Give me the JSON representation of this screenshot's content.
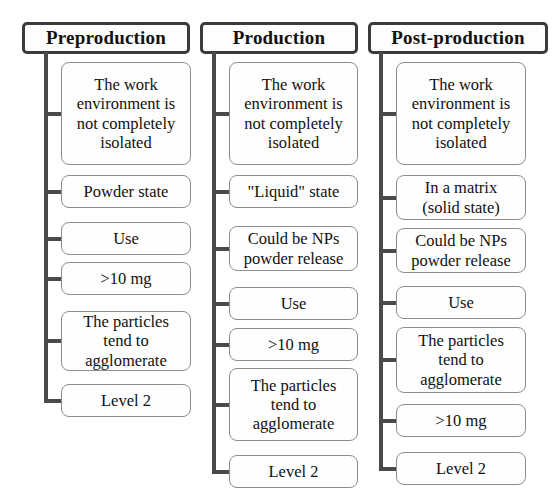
{
  "diagram": {
    "type": "three-column-bracket-list",
    "colors": {
      "header_border": "#3b3b3b",
      "connector": "#4a4a4a",
      "box_border": "#8d8d8d",
      "box_fill": "#fefefe",
      "text": "#111111",
      "background": "#ffffff"
    },
    "columns": [
      {
        "id": "preproduction",
        "header": "Preproduction",
        "items": [
          {
            "id": "pre-work-env",
            "label": "The work\nenvironment is\nnot completely\nisolated",
            "lines": 4
          },
          {
            "id": "pre-powder-state",
            "label": "Powder state",
            "lines": 1
          },
          {
            "id": "pre-use",
            "label": "Use",
            "lines": 1
          },
          {
            "id": "pre-mass",
            "label": ">10 mg",
            "lines": 1
          },
          {
            "id": "pre-agglomerate",
            "label": "The particles\ntend to\nagglomerate",
            "lines": 3
          },
          {
            "id": "pre-level",
            "label": "Level 2",
            "lines": 1
          }
        ]
      },
      {
        "id": "production",
        "header": "Production",
        "items": [
          {
            "id": "prod-work-env",
            "label": "The work\nenvironment is\nnot completely\nisolated",
            "lines": 4
          },
          {
            "id": "prod-liquid-state",
            "label": "\"Liquid\" state",
            "lines": 1
          },
          {
            "id": "prod-nps-release",
            "label": "Could be NPs\npowder release",
            "lines": 2
          },
          {
            "id": "prod-use",
            "label": "Use",
            "lines": 1
          },
          {
            "id": "prod-mass",
            "label": ">10 mg",
            "lines": 1
          },
          {
            "id": "prod-agglomerate",
            "label": "The particles\ntend to\nagglomerate",
            "lines": 3
          },
          {
            "id": "prod-level",
            "label": "Level 2",
            "lines": 1
          }
        ]
      },
      {
        "id": "post-production",
        "header": "Post-production",
        "items": [
          {
            "id": "post-work-env",
            "label": "The work\nenvironment is\nnot completely\nisolated",
            "lines": 4
          },
          {
            "id": "post-matrix",
            "label": "In a matrix\n(solid state)",
            "lines": 2
          },
          {
            "id": "post-nps-release",
            "label": "Could be NPs\npowder release",
            "lines": 2
          },
          {
            "id": "post-use",
            "label": "Use",
            "lines": 1
          },
          {
            "id": "post-agglomerate",
            "label": "The particles\ntend to\nagglomerate",
            "lines": 3
          },
          {
            "id": "post-mass",
            "label": ">10 mg",
            "lines": 1
          },
          {
            "id": "post-level",
            "label": "Level 2",
            "lines": 1
          }
        ]
      }
    ]
  },
  "layout": {
    "columns": [
      {
        "left": 22,
        "header_width": 168,
        "header_top": 22,
        "header_height": 32,
        "trunk_x": 44,
        "box_left": 61,
        "box_width": 130,
        "tops": [
          62,
          175,
          222,
          262,
          311,
          384
        ],
        "heights": [
          103,
          33,
          33,
          33,
          60,
          33
        ]
      },
      {
        "left": 200,
        "header_width": 158,
        "header_top": 22,
        "header_height": 32,
        "trunk_x": 212,
        "box_left": 229,
        "box_width": 129,
        "tops": [
          62,
          175,
          226,
          287,
          328,
          368,
          455
        ],
        "heights": [
          103,
          33,
          45,
          33,
          33,
          73,
          33
        ]
      },
      {
        "left": 368,
        "header_width": 180,
        "header_top": 22,
        "header_height": 32,
        "trunk_x": 379,
        "box_left": 396,
        "box_width": 130,
        "tops": [
          62,
          175,
          228,
          286,
          327,
          404,
          452
        ],
        "heights": [
          103,
          45,
          45,
          33,
          66,
          33,
          33
        ]
      }
    ]
  }
}
